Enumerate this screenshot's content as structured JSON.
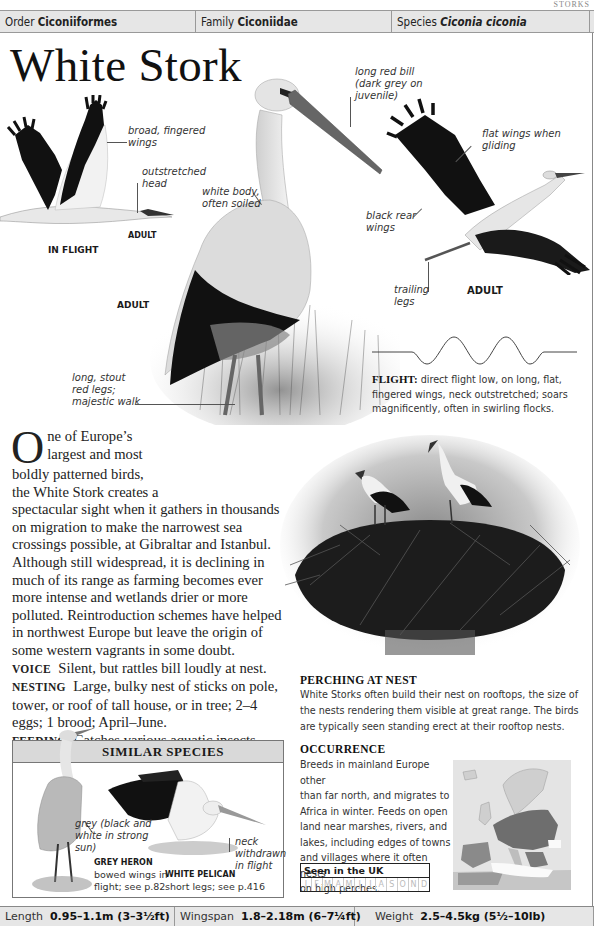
{
  "header": {
    "running_head": "STORKS",
    "order_label": "Order",
    "order_value": "Ciconiiformes",
    "family_label": "Family",
    "family_value": "Ciconiidae",
    "species_label": "Species",
    "species_value": "Ciconia ciconia"
  },
  "title": "White Stork",
  "illustrations": {
    "in_flight": {
      "caption": "IN FLIGHT",
      "sub_caption": "ADULT",
      "labels": [
        "broad, fingered wings",
        "outstretched head"
      ]
    },
    "standing_adult": {
      "caption": "ADULT",
      "labels": [
        "white body, often soiled",
        "long red bill (dark grey on juvenile)",
        "long, stout red legs; majestic walk"
      ]
    },
    "gliding_adult": {
      "caption": "ADULT",
      "labels": [
        "flat wings when gliding",
        "black rear wings",
        "trailing legs"
      ]
    }
  },
  "label_lines": {
    "broad": [
      "broad, fingered",
      "wings"
    ],
    "outstretched": [
      "outstretched",
      "head"
    ],
    "white_body": [
      "white body,",
      "often soiled"
    ],
    "bill": [
      "long red bill",
      "(dark grey on",
      "juvenile)"
    ],
    "legs": [
      "long, stout",
      "red legs;",
      "majestic walk"
    ],
    "flat": [
      "flat wings when",
      "gliding"
    ],
    "black_rear": [
      "black rear",
      "wings"
    ],
    "trailing": [
      "trailing",
      "legs"
    ]
  },
  "flight": {
    "label": "FLIGHT:",
    "text": "direct flight low, on long, flat, fingered wings, neck outstretched; soars magnificently, often in swirling flocks."
  },
  "body": {
    "drop_cap": "O",
    "intro_lines": [
      "ne of Europe’s",
      "largest and most",
      "boldly patterned birds,",
      "the White Stork creates a"
    ],
    "intro_rest": "spectacular sight when it gathers in thousands on migration to make the narrowest sea crossings possible, at Gibraltar and Istanbul. Although still widespread, it is declining in much of its range as farming becomes ever more intense and wetlands drier or more polluted. Reintroduction schemes have helped in northwest Europe but leave the origin of some western vagrants in some doubt.",
    "voice_label": "VOICE",
    "voice_text": "Silent, but rattles bill loudly at nest.",
    "nesting_label": "NESTING",
    "nesting_text": "Large, bulky nest of sticks on pole, tower, or roof of tall house, or in tree; 2–4 eggs; 1 brood; April–June.",
    "feeding_label": "FEEDING",
    "feeding_text": "Catches various aquatic insects, small rodents, frogs and toads, and small fish in damp places",
    "feeding_tail": "or shallow water."
  },
  "perching": {
    "heading": "PERCHING AT NEST",
    "text": "White Storks often build their nest on rooftops, the size of the nests rendering them visible at great range. The birds are typically seen standing erect at their rooftop nests."
  },
  "similar_species": {
    "heading": "SIMILAR SPECIES",
    "heron_note": [
      "grey (black and",
      "white in strong",
      "sun)"
    ],
    "pelican_note": [
      "neck",
      "withdrawn",
      "in flight"
    ],
    "species": [
      {
        "name": "GREY HERON",
        "desc_lines": [
          "bowed wings in",
          "flight; see p.82"
        ]
      },
      {
        "name": "WHITE PELICAN",
        "desc_lines": [
          "short legs; see p.416"
        ]
      }
    ]
  },
  "occurrence": {
    "heading": "OCCURRENCE",
    "lines": [
      "Breeds in mainland Europe other",
      "than far north, and migrates to",
      "Africa in winter. Feeds on open",
      "land near marshes, rivers, and",
      "lakes, including edges of towns",
      "and villages where it often nests",
      "on high perches."
    ]
  },
  "seen_in_uk": {
    "title": "Seen in the UK",
    "months": [
      "J",
      "F",
      "M",
      "A",
      "M",
      "J",
      "J",
      "A",
      "S",
      "O",
      "N",
      "D"
    ]
  },
  "measurements": {
    "length_label": "Length",
    "length_value": "0.95–1.1m (3–3½ft)",
    "wingspan_label": "Wingspan",
    "wingspan_value": "1.8–2.18m (6–7¼ft)",
    "weight_label": "Weight",
    "weight_value": "2.5–4.5kg (5½–10lb)"
  }
}
